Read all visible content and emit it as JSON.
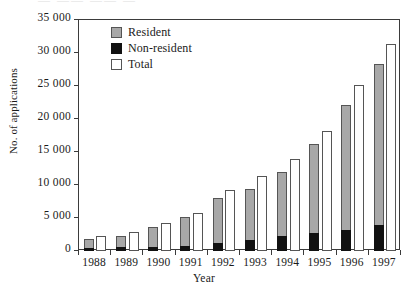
{
  "scan": {
    "top_fragment": "—  ——   ——  —"
  },
  "chart_data": {
    "type": "bar",
    "title": "",
    "xlabel": "Year",
    "ylabel": "No. of applications",
    "categories": [
      "1988",
      "1989",
      "1990",
      "1991",
      "1992",
      "1993",
      "1994",
      "1995",
      "1996",
      "1997"
    ],
    "series": [
      {
        "name": "Resident",
        "color": "#a8a8a8",
        "values": [
          1800,
          2200,
          3700,
          5200,
          8000,
          9400,
          12000,
          16200,
          22100,
          28400
        ]
      },
      {
        "name": "Non-resident",
        "color": "#111111",
        "values": [
          400,
          600,
          600,
          700,
          1200,
          1600,
          2200,
          2800,
          3200,
          4000
        ]
      },
      {
        "name": "Total",
        "color": "#ffffff",
        "values": [
          2300,
          2900,
          4300,
          5700,
          9300,
          11300,
          14000,
          18200,
          25200,
          31300
        ]
      }
    ],
    "ylim": [
      0,
      35000
    ],
    "ytick_values": [
      0,
      5000,
      10000,
      15000,
      20000,
      25000,
      30000,
      35000
    ],
    "ytick_labels": [
      "0",
      "5 000",
      "10 000",
      "15 000",
      "20 000",
      "25 000",
      "30 000",
      "35 000"
    ],
    "grid": false,
    "legend_position": "top-left",
    "legend": [
      "Resident",
      "Non-resident",
      "Total"
    ],
    "note": "Non-resident is drawn as a solid black block at the base of the Resident bar, not stacked on top."
  }
}
